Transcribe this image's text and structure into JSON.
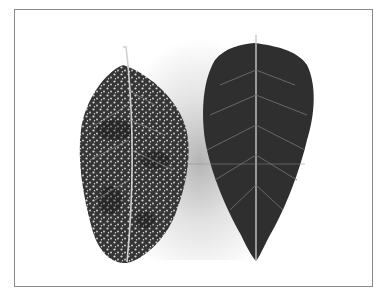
{
  "image": {
    "description": "Two leaves side by side on a white background inside a thin gray frame",
    "frame_color": "#8a8a8a",
    "background_color": "#ffffff",
    "leaves": [
      {
        "position": "left",
        "condition": "speckled with many small pale spots",
        "base_color": "#3a3a3a",
        "spot_color": "#d8d8d8"
      },
      {
        "position": "right",
        "condition": "dark, uniform with visible veins",
        "base_color": "#2e2e2e",
        "vein_color": "#9a9a9a"
      }
    ]
  }
}
